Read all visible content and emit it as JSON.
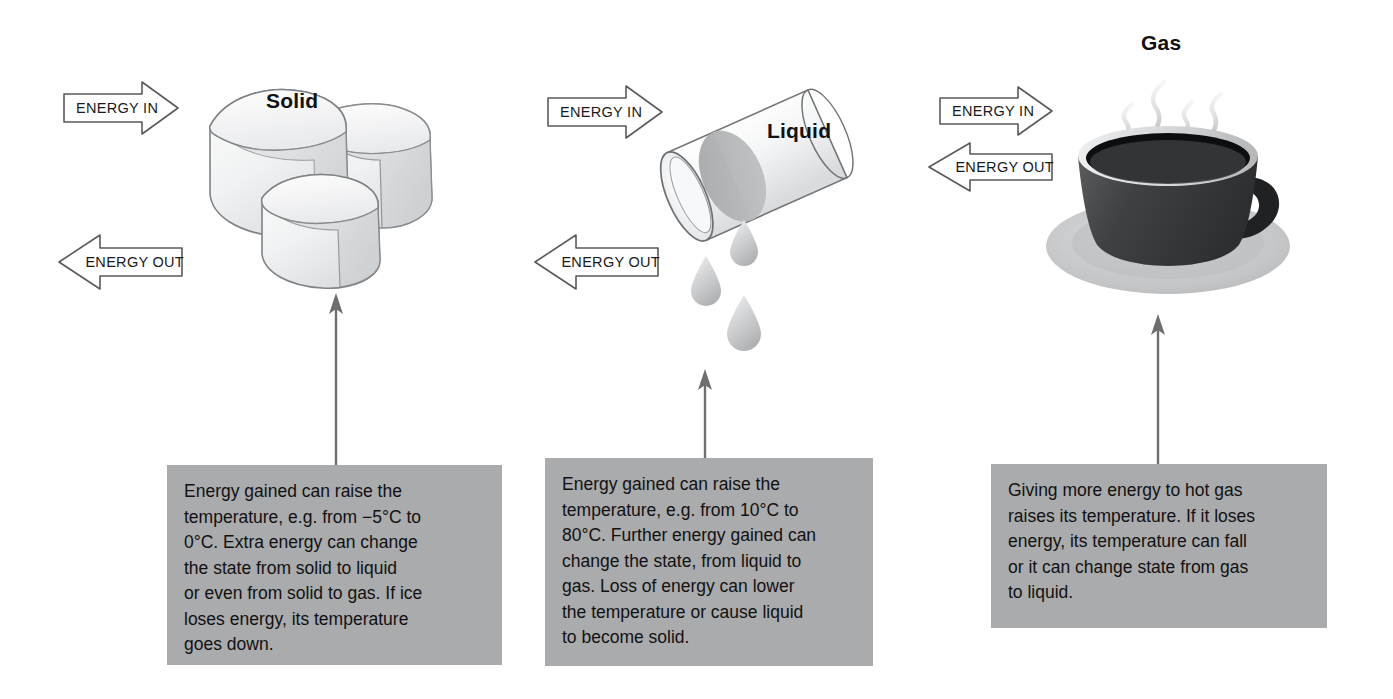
{
  "diagram": {
    "title_hidden": "Changes of state and energy",
    "columns": [
      {
        "id": "solid",
        "state_label": "Solid",
        "illustration": "ice-cubes",
        "energy_in_label": "ENERGY IN",
        "energy_out_label": "ENERGY OUT",
        "caption": "Energy gained can raise the\ntemperature, e.g. from −5°C to\n0°C. Extra energy can change\nthe state from solid to liquid\nor even from solid to gas. If ice\nloses energy, its temperature\ngoes down."
      },
      {
        "id": "liquid",
        "state_label": "Liquid",
        "illustration": "tilted-cylinder-with-droplets",
        "energy_in_label": "ENERGY IN",
        "energy_out_label": "ENERGY OUT",
        "caption": "Energy gained can raise the\ntemperature, e.g. from 10°C to\n80°C. Further energy gained can\nchange the state, from liquid to\ngas. Loss of energy can lower\nthe temperature or cause liquid\nto become solid."
      },
      {
        "id": "gas",
        "state_label": "Gas",
        "illustration": "steaming-coffee-cup",
        "energy_in_label": "ENERGY IN",
        "energy_out_label": "ENERGY OUT",
        "caption": "Giving more energy to hot gas\nraises its temperature. If it loses\nenergy, its temperature can fall\nor it can change state from gas\nto liquid."
      }
    ],
    "colors": {
      "background": "#ffffff",
      "caption_box": "#aaabad",
      "arrow_outline": "#555555",
      "connector_arrow": "#6b6b6b",
      "text": "#111111",
      "ice_light": "#fbfbfb",
      "ice_shade": "#d4d6d8",
      "cup_dark": "#3c3c3c",
      "cup_coffee": "#111111",
      "saucer": "#c8cacc"
    }
  }
}
